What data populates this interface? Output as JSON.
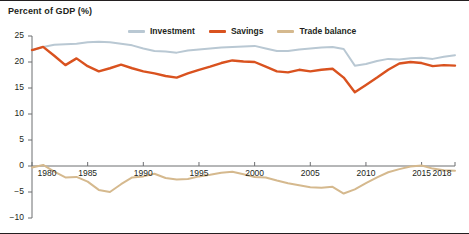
{
  "chart_data": {
    "type": "line",
    "title": "Percent of GDP (%)",
    "xlabel": "",
    "ylabel": "Percent of GDP (%)",
    "xlim": [
      1980,
      2018
    ],
    "ylim": [
      -10,
      25
    ],
    "grid": false,
    "legend_position": "top",
    "y_ticks": [
      25,
      20,
      15,
      10,
      5,
      0,
      -5,
      -10
    ],
    "y_tick_labels": [
      "25",
      "20",
      "15",
      "10",
      "5",
      "0",
      "−5",
      "−10"
    ],
    "x_ticks": [
      1980,
      1985,
      1990,
      1995,
      2000,
      2005,
      2010,
      2015,
      2018
    ],
    "x_tick_labels": [
      "1980",
      "1985",
      "1990",
      "1995",
      "2000",
      "2005",
      "2010",
      "2015",
      "2018"
    ],
    "x": [
      1980,
      1981,
      1982,
      1983,
      1984,
      1985,
      1986,
      1987,
      1988,
      1989,
      1990,
      1991,
      1992,
      1993,
      1994,
      1995,
      1996,
      1997,
      1998,
      1999,
      2000,
      2001,
      2002,
      2003,
      2004,
      2005,
      2006,
      2007,
      2008,
      2009,
      2010,
      2011,
      2012,
      2013,
      2014,
      2015,
      2016,
      2017,
      2018
    ],
    "series": [
      {
        "name": "Investment",
        "color": "#b9c8d3",
        "values": [
          22.2,
          22.9,
          23.3,
          23.4,
          23.5,
          23.8,
          23.9,
          23.8,
          23.5,
          23.2,
          22.6,
          22.1,
          22.0,
          21.8,
          22.2,
          22.4,
          22.6,
          22.8,
          22.9,
          23.0,
          23.1,
          22.6,
          22.1,
          22.1,
          22.4,
          22.6,
          22.8,
          22.9,
          22.5,
          19.3,
          19.6,
          20.2,
          20.6,
          20.5,
          20.7,
          20.8,
          20.6,
          21.0,
          21.3
        ]
      },
      {
        "name": "Savings",
        "color": "#d9521f",
        "values": [
          22.3,
          22.9,
          21.2,
          19.4,
          20.7,
          19.2,
          18.2,
          18.8,
          19.5,
          18.8,
          18.2,
          17.8,
          17.3,
          17.0,
          17.8,
          18.5,
          19.1,
          19.8,
          20.3,
          20.1,
          20.0,
          19.1,
          18.2,
          18.0,
          18.5,
          18.2,
          18.5,
          18.7,
          17.0,
          14.2,
          15.6,
          17.0,
          18.5,
          19.7,
          20.0,
          19.8,
          19.2,
          19.4,
          19.3
        ]
      },
      {
        "name": "Trade balance",
        "color": "#d5b98e",
        "values": [
          -0.3,
          0.2,
          -1.1,
          -2.2,
          -2.1,
          -3.0,
          -4.6,
          -5.0,
          -3.5,
          -2.2,
          -2.0,
          -1.5,
          -2.3,
          -2.6,
          -2.5,
          -2.0,
          -1.7,
          -1.3,
          -1.1,
          -1.6,
          -2.1,
          -2.2,
          -2.8,
          -3.3,
          -3.7,
          -4.1,
          -4.2,
          -4.0,
          -5.3,
          -4.5,
          -3.3,
          -2.2,
          -1.2,
          -0.6,
          -0.1,
          0.1,
          -0.5,
          -0.8,
          -0.9
        ]
      }
    ]
  }
}
